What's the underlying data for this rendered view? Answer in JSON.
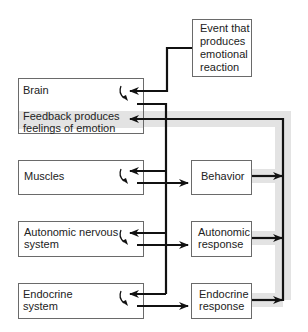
{
  "diagram": {
    "colors": {
      "line": "#111111",
      "box_border": "#6a6a6a",
      "feedback_band": "#e3e3e3",
      "text": "#222222"
    },
    "nodes": {
      "event": {
        "line1": "Event that",
        "line2": "produces",
        "line3": "emotional",
        "line4": "reaction"
      },
      "brain": {
        "label": "Brain",
        "feedback_line1": "Feedback produces",
        "feedback_line2": "feelings of emotion"
      },
      "muscles": {
        "label": "Muscles"
      },
      "ans": {
        "line1": "Autonomic nervous",
        "line2": "system"
      },
      "endocrine": {
        "line1": "Endocrine",
        "line2": "system"
      },
      "behavior": {
        "label": "Behavior"
      },
      "autonomic_response": {
        "line1": "Autonomic",
        "line2": "response"
      },
      "endocrine_response": {
        "line1": "Endocrine",
        "line2": "response"
      }
    },
    "edges": [
      {
        "from": "event",
        "to": "brain"
      },
      {
        "from": "brain",
        "to": "muscles"
      },
      {
        "from": "brain",
        "to": "ans"
      },
      {
        "from": "brain",
        "to": "endocrine"
      },
      {
        "from": "muscles",
        "to": "behavior"
      },
      {
        "from": "ans",
        "to": "autonomic_response"
      },
      {
        "from": "endocrine",
        "to": "endocrine_response"
      },
      {
        "from": "behavior",
        "to": "brain",
        "type": "feedback"
      },
      {
        "from": "autonomic_response",
        "to": "brain",
        "type": "feedback"
      },
      {
        "from": "endocrine_response",
        "to": "brain",
        "type": "feedback"
      }
    ]
  }
}
